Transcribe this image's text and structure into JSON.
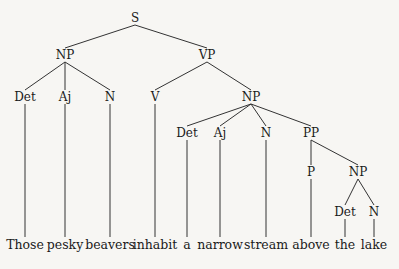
{
  "tree": {
    "nodes": [
      {
        "id": "S",
        "label": "S",
        "x": 135,
        "y": 18
      },
      {
        "id": "NP1",
        "label": "NP",
        "x": 65,
        "y": 55
      },
      {
        "id": "VP",
        "label": "VP",
        "x": 207,
        "y": 55
      },
      {
        "id": "Det1",
        "label": "Det",
        "x": 25,
        "y": 97
      },
      {
        "id": "Aj1",
        "label": "Aj",
        "x": 65,
        "y": 97
      },
      {
        "id": "N1",
        "label": "N",
        "x": 110,
        "y": 97
      },
      {
        "id": "V",
        "label": "V",
        "x": 155,
        "y": 97
      },
      {
        "id": "NP2",
        "label": "NP",
        "x": 251,
        "y": 97
      },
      {
        "id": "Det2",
        "label": "Det",
        "x": 187,
        "y": 133
      },
      {
        "id": "Aj2",
        "label": "Aj",
        "x": 220,
        "y": 133
      },
      {
        "id": "N2",
        "label": "N",
        "x": 266,
        "y": 133
      },
      {
        "id": "PP",
        "label": "PP",
        "x": 311,
        "y": 133
      },
      {
        "id": "P",
        "label": "P",
        "x": 311,
        "y": 172
      },
      {
        "id": "NP3",
        "label": "NP",
        "x": 358,
        "y": 172
      },
      {
        "id": "Det3",
        "label": "Det",
        "x": 345,
        "y": 212
      },
      {
        "id": "N3",
        "label": "N",
        "x": 374,
        "y": 212
      }
    ],
    "edges": [
      [
        "S",
        "NP1"
      ],
      [
        "S",
        "VP"
      ],
      [
        "NP1",
        "Det1"
      ],
      [
        "NP1",
        "Aj1"
      ],
      [
        "NP1",
        "N1"
      ],
      [
        "VP",
        "V"
      ],
      [
        "VP",
        "NP2"
      ],
      [
        "NP2",
        "Det2"
      ],
      [
        "NP2",
        "Aj2"
      ],
      [
        "NP2",
        "N2"
      ],
      [
        "NP2",
        "PP"
      ],
      [
        "PP",
        "P"
      ],
      [
        "PP",
        "NP3"
      ],
      [
        "NP3",
        "Det3"
      ],
      [
        "NP3",
        "N3"
      ]
    ],
    "words": [
      {
        "text": "Those",
        "x": 25,
        "parent": "Det1"
      },
      {
        "text": "pesky",
        "x": 65,
        "parent": "Aj1"
      },
      {
        "text": "beavers",
        "x": 110,
        "parent": "N1"
      },
      {
        "text": "inhabit",
        "x": 155,
        "parent": "V"
      },
      {
        "text": "a",
        "x": 187,
        "parent": "Det2"
      },
      {
        "text": "narrow",
        "x": 220,
        "parent": "Aj2"
      },
      {
        "text": "stream",
        "x": 266,
        "parent": "N2"
      },
      {
        "text": "above",
        "x": 311,
        "parent": "P"
      },
      {
        "text": "the",
        "x": 345,
        "parent": "Det3"
      },
      {
        "text": "lake",
        "x": 374,
        "parent": "N3"
      }
    ],
    "word_y": 245
  }
}
